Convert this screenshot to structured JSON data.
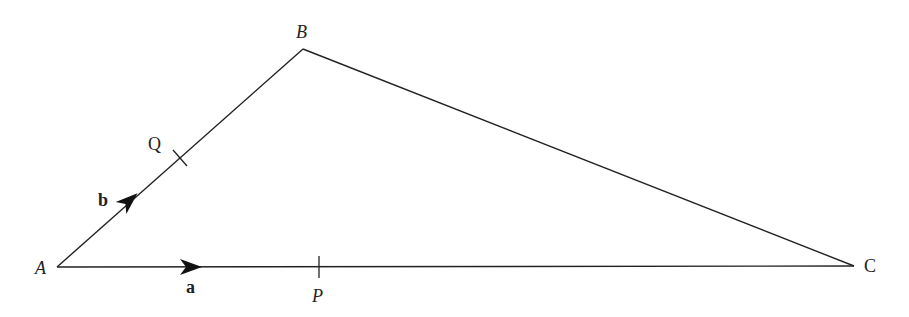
{
  "diagram": {
    "type": "triangle-vectors",
    "vertices": {
      "A": {
        "label": "A",
        "x": 57,
        "y": 267
      },
      "B": {
        "label": "B",
        "x": 303,
        "y": 49
      },
      "C": {
        "label": "C",
        "x": 854,
        "y": 266
      }
    },
    "points": {
      "Q": {
        "label": "Q",
        "on": "AB"
      },
      "P": {
        "label": "P",
        "on": "AC"
      }
    },
    "vectors": {
      "a": {
        "label": "a",
        "along": "AC"
      },
      "b": {
        "label": "b",
        "along": "AB"
      }
    },
    "colors": {
      "stroke": "#222222",
      "background": "#ffffff"
    }
  }
}
